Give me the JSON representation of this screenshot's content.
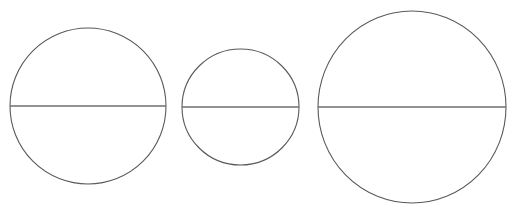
{
  "canvas": {
    "width": 528,
    "height": 214,
    "background_color": "#ffffff",
    "title": "Three bisected circles"
  },
  "style": {
    "circle_stroke_color": "#595959",
    "circle_stroke_width": 1.1,
    "diameter_stroke_color": "#6e6e6e",
    "diameter_stroke_width": 1.6,
    "fill": "none"
  },
  "chart_data": {
    "type": "diagram",
    "shape_count": 3,
    "shapes": [
      {
        "id": "circle-1",
        "label": "Left circle",
        "cx": 88,
        "cy": 106,
        "rx": 78,
        "ry": 78,
        "diameter": 156,
        "bbox": {
          "left": 10,
          "top": 28,
          "right": 166,
          "bottom": 184
        },
        "diameter_line": {
          "x1": 10,
          "y1": 106,
          "x2": 166,
          "y2": 106
        },
        "size_rank": 2
      },
      {
        "id": "circle-2",
        "label": "Middle circle",
        "cx": 240.5,
        "cy": 107,
        "rx": 58.5,
        "ry": 58,
        "diameter": 117,
        "bbox": {
          "left": 182,
          "top": 49,
          "right": 299,
          "bottom": 165
        },
        "diameter_line": {
          "x1": 182,
          "y1": 107,
          "x2": 299,
          "y2": 107
        },
        "size_rank": 3
      },
      {
        "id": "circle-3",
        "label": "Right circle",
        "cx": 412,
        "cy": 107,
        "rx": 94,
        "ry": 96,
        "diameter": 188,
        "bbox": {
          "left": 318,
          "top": 11,
          "right": 506,
          "bottom": 203
        },
        "diameter_line": {
          "x1": 318,
          "y1": 107,
          "x2": 506,
          "y2": 107
        },
        "size_rank": 1
      }
    ],
    "annotations": [],
    "legend": [],
    "grid": false
  }
}
